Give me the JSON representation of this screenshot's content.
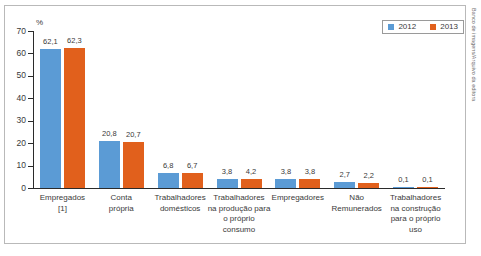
{
  "chart_data": {
    "type": "bar",
    "title": "",
    "xlabel": "",
    "ylabel": "%",
    "ylim": [
      0,
      70
    ],
    "yticks": [
      0,
      10,
      20,
      30,
      40,
      50,
      60,
      70
    ],
    "grid": false,
    "legend_position": "top-right",
    "categories": [
      "Empregados\n[1]",
      "Conta\nprópria",
      "Trabalhadores\ndomésticos",
      "Trabalhadores\nna produção para\no próprio consumo",
      "Empregadores",
      "Não\nRemunerados",
      "Trabalhadores\nna construção\npara o próprio\nuso"
    ],
    "category_lines": [
      [
        "Empregados",
        "[1]"
      ],
      [
        "Conta",
        "própria"
      ],
      [
        "Trabalhadores",
        "domésticos"
      ],
      [
        "Trabalhadores",
        "na produção para",
        "o próprio consumo"
      ],
      [
        "Empregadores"
      ],
      [
        "Não",
        "Remunerados"
      ],
      [
        "Trabalhadores",
        "na construção",
        "para o próprio",
        "uso"
      ]
    ],
    "series": [
      {
        "name": "2012",
        "color": "#5B9BD5",
        "values": [
          62.1,
          20.8,
          6.8,
          3.8,
          3.8,
          2.7,
          0.1
        ],
        "labels": [
          "62,1",
          "20,8",
          "6,8",
          "3,8",
          "3,8",
          "2,7",
          "0,1"
        ]
      },
      {
        "name": "2013",
        "color": "#E1601C",
        "values": [
          62.3,
          20.7,
          6.7,
          4.2,
          3.8,
          2.2,
          0.1
        ],
        "labels": [
          "62,3",
          "20,7",
          "6,7",
          "4,2",
          "3,8",
          "2,2",
          "0,1"
        ]
      }
    ]
  },
  "axis": {
    "unit_label": "%",
    "tick_labels": [
      "70",
      "60",
      "50",
      "40",
      "30",
      "20",
      "10",
      "0"
    ]
  },
  "legend": {
    "items": [
      {
        "label": "2012",
        "color": "#5B9BD5"
      },
      {
        "label": "2013",
        "color": "#E1601C"
      }
    ]
  },
  "credit": {
    "text": "Banco de imagens/Arquivo da editora"
  }
}
